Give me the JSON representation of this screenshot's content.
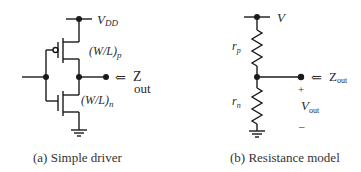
{
  "figure_a": {
    "caption": "(a) Simple driver",
    "supply_label": "V",
    "supply_sub": "DD",
    "pmos_label": "(W/L)",
    "pmos_sub": "p",
    "nmos_label": "(W/L)",
    "nmos_sub": "n",
    "arrow": "⇐",
    "zout_label": "Z",
    "zout_sub": "out"
  },
  "figure_b": {
    "caption": "(b) Resistance model",
    "supply_label": "V",
    "rp_label": "r",
    "rp_sub": "p",
    "rn_label": "r",
    "rn_sub": "n",
    "arrow": "⇐",
    "zout_label": "Z",
    "zout_sub": "out",
    "plus": "+",
    "vout_label": "V",
    "vout_sub": "out",
    "minus": "–"
  },
  "colors": {
    "line": "#1a1a1a",
    "text": "#2a2a2a"
  }
}
